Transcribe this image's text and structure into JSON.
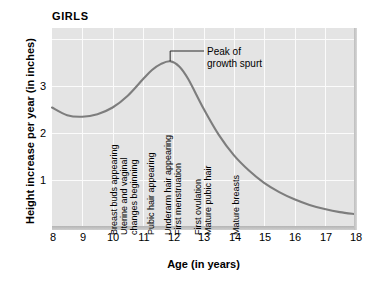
{
  "chart_data": {
    "type": "line",
    "title": "GIRLS",
    "xlabel": "Age (in years)",
    "ylabel": "Height increase per year (in inches)",
    "xlim": [
      8,
      18
    ],
    "ylim": [
      0,
      3.9
    ],
    "xticks": [
      "8",
      "9",
      "10",
      "11",
      "12",
      "13",
      "14",
      "15",
      "16",
      "17",
      "18"
    ],
    "yticks": [
      "1",
      "2",
      "3"
    ],
    "grid": true,
    "legend": "none",
    "series": [
      {
        "name": "Height increase per year",
        "x": [
          8.0,
          8.5,
          9.0,
          9.5,
          10.0,
          10.5,
          11.0,
          11.3,
          11.6,
          11.9,
          12.2,
          12.5,
          13.0,
          13.5,
          14.0,
          14.5,
          15.0,
          15.5,
          16.0,
          16.5,
          17.0,
          17.5,
          18.0
        ],
        "y": [
          2.35,
          2.2,
          2.17,
          2.22,
          2.35,
          2.58,
          2.9,
          3.08,
          3.2,
          3.25,
          3.15,
          2.9,
          2.33,
          1.82,
          1.42,
          1.12,
          0.88,
          0.7,
          0.56,
          0.45,
          0.37,
          0.31,
          0.27
        ]
      }
    ],
    "annotations": [
      {
        "text": "Breast buds appearing",
        "age": 10.2
      },
      {
        "text": "Uterine and vaginal",
        "age": 10.5
      },
      {
        "text": "changes beginning",
        "age": 10.85
      },
      {
        "text": "Pubic hair appearing",
        "age": 11.4
      },
      {
        "text": "Underarm hair appearing",
        "age": 11.95
      },
      {
        "text": "First menstruation",
        "age": 12.3
      },
      {
        "text": "First ovulation",
        "age": 12.95
      },
      {
        "text": "Mature pubic hair",
        "age": 13.3
      },
      {
        "text": "Mature breasts",
        "age": 14.2
      }
    ],
    "callout": {
      "line1": "Peak of",
      "line2": "growth spurt",
      "peak_age": 11.9,
      "peak_value": 3.25
    },
    "colors": {
      "plot_background": "#e4e4e4",
      "gridline": "#fbfbfb",
      "curve": "#7d7d7d",
      "text": "#000000"
    }
  }
}
